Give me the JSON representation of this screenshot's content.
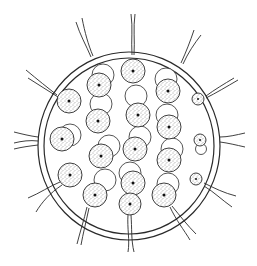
{
  "figure": {
    "colors": {
      "line": "#2a2a2a",
      "background": "#ffffff",
      "stipple": "#3a3a3a"
    },
    "colony": {
      "cx": 129,
      "cy": 146,
      "outer_r": 92,
      "inner_r": 86
    },
    "cells": [
      {
        "x": 69,
        "y": 101,
        "r": 12,
        "ghost": null,
        "flagella": "upleft"
      },
      {
        "x": 62,
        "y": 139,
        "r": 12,
        "ghost": [
          70,
          135
        ],
        "flagella": null
      },
      {
        "x": 70,
        "y": 175,
        "r": 12,
        "ghost": null,
        "flagella": "downleft"
      },
      {
        "x": 99,
        "y": 85,
        "r": 12,
        "ghost": [
          103,
          75
        ],
        "flagella": null
      },
      {
        "x": 98,
        "y": 121,
        "r": 12,
        "ghost": [
          101,
          104
        ],
        "flagella": null
      },
      {
        "x": 101,
        "y": 156,
        "r": 12,
        "ghost": [
          109,
          146
        ],
        "flagella": null
      },
      {
        "x": 95,
        "y": 195,
        "r": 12,
        "ghost": [
          105,
          180
        ],
        "flagella": "down"
      },
      {
        "x": 133,
        "y": 71,
        "r": 12,
        "ghost": null,
        "flagella": "up"
      },
      {
        "x": 138,
        "y": 115,
        "r": 12,
        "ghost": [
          136,
          96
        ],
        "flagella": null
      },
      {
        "x": 135,
        "y": 149,
        "r": 12,
        "ghost": [
          140,
          137
        ],
        "flagella": null
      },
      {
        "x": 133,
        "y": 183,
        "r": 12,
        "ghost": [
          130,
          173
        ],
        "flagella": null
      },
      {
        "x": 130,
        "y": 204,
        "r": 11,
        "ghost": null,
        "flagella": "down"
      },
      {
        "x": 168,
        "y": 91,
        "r": 12,
        "ghost": [
          166,
          79
        ],
        "flagella": null
      },
      {
        "x": 169,
        "y": 127,
        "r": 12,
        "ghost": [
          167,
          115
        ],
        "flagella": null
      },
      {
        "x": 169,
        "y": 160,
        "r": 12,
        "ghost": [
          172,
          149
        ],
        "flagella": null
      },
      {
        "x": 164,
        "y": 195,
        "r": 12,
        "ghost": [
          168,
          184
        ],
        "flagella": "downright"
      },
      {
        "x": 198,
        "y": 99,
        "r": 6,
        "ghost": null,
        "flagella": "upright"
      },
      {
        "x": 200,
        "y": 140,
        "r": 6,
        "ghost": [
          201,
          149
        ],
        "flagella": "right"
      },
      {
        "x": 196,
        "y": 179,
        "r": 6,
        "ghost": null,
        "flagella": "downright"
      }
    ]
  }
}
